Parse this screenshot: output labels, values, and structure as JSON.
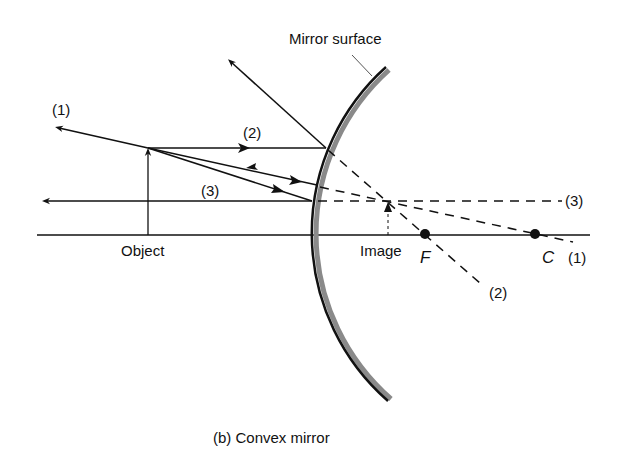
{
  "figure": {
    "caption": "(b) Convex mirror",
    "mirror_label": "Mirror surface",
    "object_label": "Object",
    "image_label": "Image",
    "focal_point_label": "F",
    "center_label": "C",
    "ray_labels": {
      "ray1_incident": "(1)",
      "ray1_virtual": "(1)",
      "ray2_incident": "(2)",
      "ray2_virtual": "(2)",
      "ray3_incident": "(3)",
      "ray3_virtual": "(3)"
    }
  },
  "colors": {
    "ink": "#111111",
    "mirror_back": "#8a8a8a",
    "background": "#ffffff"
  }
}
